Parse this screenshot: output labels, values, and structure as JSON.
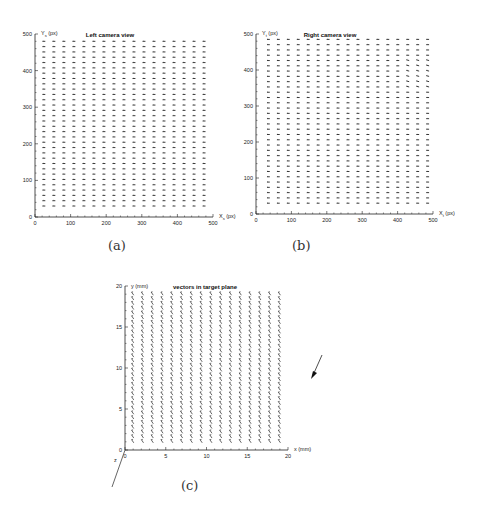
{
  "chart_data": [
    {
      "id": "a",
      "type": "quiver",
      "title": "Left camera view",
      "xlabel": "X_s (px)",
      "ylabel": "Y_s (px)",
      "xlim": [
        0,
        500
      ],
      "ylim": [
        0,
        500
      ],
      "xticks": [
        0,
        100,
        200,
        300,
        400,
        500
      ],
      "yticks": [
        0,
        100,
        200,
        300,
        400,
        500
      ],
      "grid": {
        "columns": 17,
        "rows": 32,
        "x_start": 25,
        "x_end": 475,
        "y_start": 30,
        "y_end": 480
      },
      "vector": {
        "dx": -8,
        "dy": 0
      },
      "caption": "(a)"
    },
    {
      "id": "b",
      "type": "quiver",
      "title": "Right camera view",
      "xlabel": "X_t (px)",
      "ylabel": "Y_t (px)",
      "xlim": [
        0,
        500
      ],
      "ylim": [
        0,
        500
      ],
      "xticks": [
        0,
        100,
        200,
        300,
        400,
        500
      ],
      "yticks": [
        0,
        100,
        200,
        300,
        400,
        500
      ],
      "grid": {
        "columns": 17,
        "rows": 32,
        "x_start": 35,
        "x_end": 485,
        "y_start": 30,
        "y_end": 485
      },
      "vector": {
        "dx": -8,
        "dy": 0
      },
      "caption": "(b)"
    },
    {
      "id": "c",
      "type": "quiver",
      "title": "vectors in target plane",
      "xlabel": "x (mm)",
      "ylabel": "y (mm)",
      "zlabel": "z",
      "xlim": [
        0,
        20
      ],
      "ylim": [
        0,
        20
      ],
      "xticks": [
        0,
        5,
        10,
        15,
        20
      ],
      "yticks": [
        0,
        5,
        10,
        15,
        20
      ],
      "grid": {
        "columns": 16,
        "rows": 32,
        "x_start": 1,
        "x_end": 19,
        "y_start": 1,
        "y_end": 19
      },
      "vector": {
        "dx": -0.25,
        "dy": 0.35
      },
      "legend_arrow": "reference vector arrow pointing down-left",
      "caption": "(c)"
    }
  ],
  "captions": {
    "a": "(a)",
    "b": "(b)",
    "c": "(c)"
  }
}
